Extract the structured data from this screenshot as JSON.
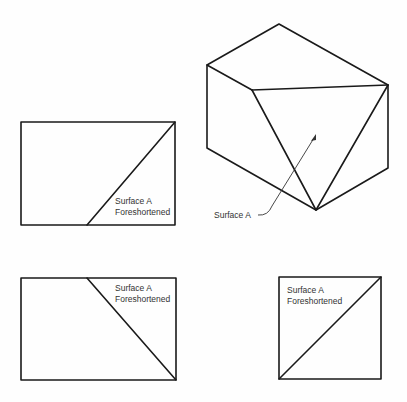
{
  "diagram": {
    "type": "orthographic-projection",
    "isometric_label": "Surface A",
    "views": [
      {
        "name": "front-view",
        "label_line1": "Surface A",
        "label_line2": "Foreshortened"
      },
      {
        "name": "top-view",
        "label_line1": "Surface A",
        "label_line2": "Foreshortened"
      },
      {
        "name": "side-view",
        "label_line1": "Surface A",
        "label_line2": "Foreshortened"
      }
    ]
  }
}
